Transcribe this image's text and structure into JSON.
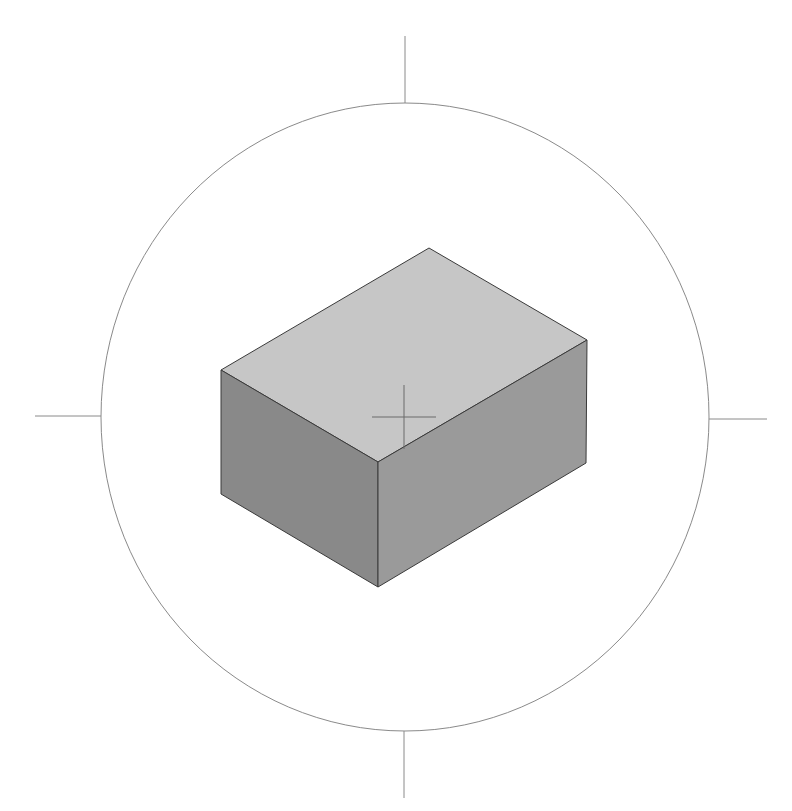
{
  "viewport": {
    "background": "#ffffff",
    "circle": {
      "cx": 405,
      "cy": 417,
      "rx": 304,
      "ry": 314,
      "stroke": "#8a8a8a"
    },
    "ticks": [
      {
        "name": "tick-top",
        "x1": 405,
        "y1": 36,
        "x2": 405,
        "y2": 103
      },
      {
        "name": "tick-bottom",
        "x1": 404,
        "y1": 731,
        "x2": 404,
        "y2": 798
      },
      {
        "name": "tick-left",
        "x1": 35,
        "y1": 416,
        "x2": 101,
        "y2": 416
      },
      {
        "name": "tick-right",
        "x1": 709,
        "y1": 419,
        "x2": 767,
        "y2": 419
      }
    ],
    "crosshair": {
      "cx": 404,
      "cy": 417,
      "half_w": 32,
      "half_h": 32,
      "stroke": "#6a6a6a"
    }
  },
  "box": {
    "top_face": {
      "points": "429,248 587,340 378,462 221,370",
      "fill": "#c6c6c6"
    },
    "left_face": {
      "points": "221,370 378,462 378,587 221,494",
      "fill": "#898989"
    },
    "right_face": {
      "points": "378,462 587,340 586,463 378,587",
      "fill": "#9a9a9a"
    },
    "edge_color": "#3a3a3a"
  }
}
